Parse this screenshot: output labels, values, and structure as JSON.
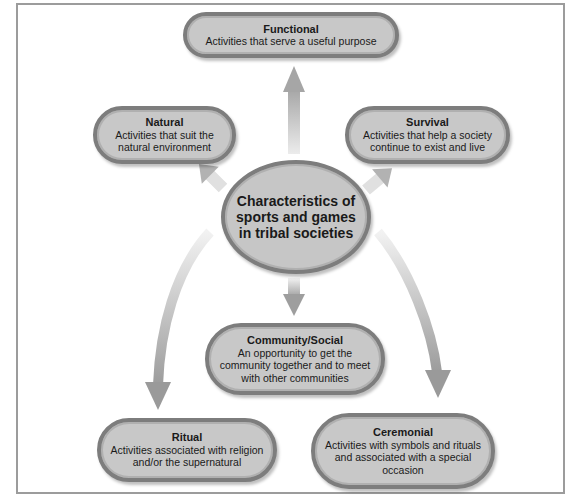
{
  "diagram": {
    "center": {
      "label": "Characteristics of sports and games in tribal societies"
    },
    "nodes": [
      {
        "id": "functional",
        "title": "Functional",
        "description": "Activities that serve a useful purpose"
      },
      {
        "id": "natural",
        "title": "Natural",
        "description": "Activities that suit the natural environment"
      },
      {
        "id": "survival",
        "title": "Survival",
        "description": "Activities that help a society continue to exist and live"
      },
      {
        "id": "community",
        "title": "Community/Social",
        "description": "An opportunity to get the community together and to meet with other communities"
      },
      {
        "id": "ritual",
        "title": "Ritual",
        "description": "Activities associated with religion and/or the supernatural"
      },
      {
        "id": "ceremonial",
        "title": "Ceremonial",
        "description": "Activities with symbols and rituals and associated with a special occasion"
      }
    ],
    "colors": {
      "node_fill": "#c8c8c8",
      "node_border": "#7d7d7d",
      "arrow": "#a8a8a8",
      "frame": "#9c9c9c"
    }
  }
}
